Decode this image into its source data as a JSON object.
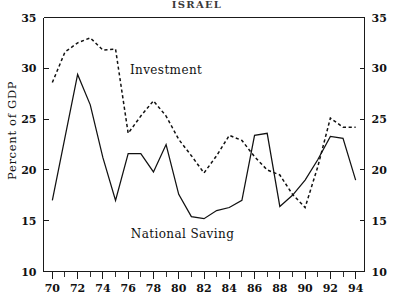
{
  "chart_data": {
    "type": "line",
    "title": "ISRAEL",
    "xlabel": "",
    "ylabel": "Percent of GDP",
    "xlim": [
      69.3,
      94.7
    ],
    "ylim": [
      10,
      35
    ],
    "grid": false,
    "legend_position": "inline-annotation",
    "x": [
      70,
      71,
      72,
      73,
      74,
      75,
      76,
      77,
      78,
      79,
      80,
      81,
      82,
      83,
      84,
      85,
      86,
      87,
      88,
      89,
      90,
      91,
      92,
      93,
      94
    ],
    "series": [
      {
        "name": "Investment",
        "style": "dashed",
        "values": [
          28.6,
          31.6,
          32.5,
          33.0,
          31.8,
          31.9,
          23.6,
          25.3,
          26.8,
          25.3,
          23.0,
          21.4,
          19.7,
          21.4,
          23.4,
          22.9,
          21.3,
          20.0,
          19.5,
          17.6,
          16.3,
          20.3,
          25.1,
          24.2,
          24.2
        ]
      },
      {
        "name": "National Saving",
        "style": "solid",
        "values": [
          17.0,
          23.2,
          29.4,
          26.4,
          21.2,
          17.0,
          21.6,
          21.6,
          19.8,
          22.5,
          17.6,
          15.4,
          15.2,
          16.0,
          16.3,
          17.0,
          23.4,
          23.6,
          16.4,
          17.5,
          19.0,
          21.0,
          23.3,
          23.1,
          19.0
        ]
      }
    ],
    "axes": {
      "y_ticks": [
        10,
        15,
        20,
        25,
        30,
        35
      ],
      "y_tick_labels": [
        "10",
        "15",
        "20",
        "25",
        "30",
        "35"
      ],
      "y_ticks_right": [
        10,
        15,
        20,
        25,
        30,
        35
      ],
      "y_tick_labels_right": [
        "10",
        "15",
        "20",
        "25",
        "30",
        "35"
      ],
      "x_ticks": [
        70,
        72,
        74,
        76,
        78,
        80,
        82,
        84,
        86,
        88,
        90,
        92,
        94
      ],
      "x_tick_labels": [
        "70",
        "72",
        "74",
        "76",
        "78",
        "80",
        "82",
        "84",
        "86",
        "88",
        "90",
        "92",
        "94"
      ],
      "x_minor_ticks": [
        71,
        73,
        75,
        77,
        79,
        81,
        83,
        85,
        87,
        89,
        91,
        93
      ]
    },
    "annotations": [
      {
        "text": "Investment",
        "x": 79.0,
        "y": 29.4
      },
      {
        "text": "National Saving",
        "x": 80.3,
        "y": 13.3
      }
    ]
  },
  "colors": {
    "ink": "#111111",
    "background": "#ffffff",
    "title_ink": "#3a3a3a"
  }
}
